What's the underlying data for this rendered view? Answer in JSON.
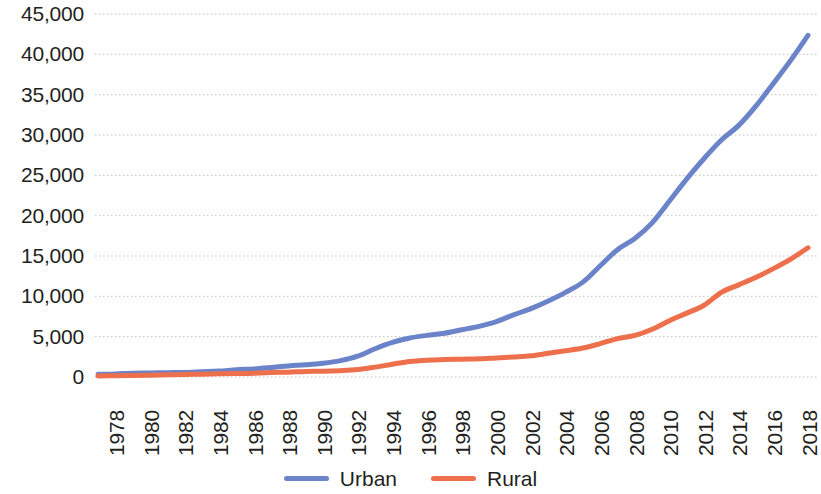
{
  "chart_data": {
    "type": "line",
    "title": "",
    "subtitle": "",
    "xlabel": "",
    "ylabel": "",
    "grid": true,
    "grid_axis": "y",
    "legend_position": "bottom-center",
    "xlim": [
      1978,
      2019
    ],
    "ylim": [
      0,
      45000
    ],
    "y_ticks": [
      0,
      5000,
      10000,
      15000,
      20000,
      25000,
      30000,
      35000,
      40000,
      45000
    ],
    "y_tick_labels": [
      "0",
      "5,000",
      "10,000",
      "15,000",
      "20,000",
      "25,000",
      "30,000",
      "35,000",
      "40,000",
      "45,000"
    ],
    "x_ticks": [
      1978,
      1980,
      1982,
      1984,
      1986,
      1988,
      1990,
      1992,
      1994,
      1996,
      1998,
      2000,
      2002,
      2004,
      2006,
      2008,
      2010,
      2012,
      2014,
      2016,
      2018
    ],
    "x_tick_labels": [
      "1978",
      "1980",
      "1982",
      "1984",
      "1986",
      "1988",
      "1990",
      "1992",
      "1994",
      "1996",
      "1998",
      "2000",
      "2002",
      "2004",
      "2006",
      "2008",
      "2010",
      "2012",
      "2014",
      "2016",
      "2018"
    ],
    "x_tick_rotation": -90,
    "x": [
      1978,
      1979,
      1980,
      1981,
      1982,
      1983,
      1984,
      1985,
      1986,
      1987,
      1988,
      1989,
      1990,
      1991,
      1992,
      1993,
      1994,
      1995,
      1996,
      1997,
      1998,
      1999,
      2000,
      2001,
      2002,
      2003,
      2004,
      2005,
      2006,
      2007,
      2008,
      2009,
      2010,
      2011,
      2012,
      2013,
      2014,
      2015,
      2016,
      2017,
      2018,
      2019
    ],
    "series": [
      {
        "name": "Urban",
        "color": "#6b83c8",
        "values": [
          343,
          387,
          478,
          500,
          535,
          564,
          652,
          739,
          900,
          1002,
          1181,
          1376,
          1510,
          1701,
          2027,
          2577,
          3496,
          4283,
          4839,
          5160,
          5425,
          5854,
          6280,
          6867,
          7703,
          8472,
          9422,
          10493,
          11759,
          13786,
          15781,
          17175,
          19109,
          21810,
          24565,
          27091,
          29381,
          31195,
          33616,
          36396,
          39251,
          42359
        ]
      },
      {
        "name": "Rural",
        "color": "#ed6f4c",
        "values": [
          134,
          160,
          191,
          223,
          270,
          310,
          355,
          398,
          424,
          463,
          545,
          602,
          686,
          709,
          784,
          922,
          1221,
          1578,
          1926,
          2090,
          2162,
          2210,
          2253,
          2366,
          2476,
          2622,
          2936,
          3255,
          3587,
          4140,
          4761,
          5153,
          5919,
          6977,
          7917,
          8896,
          10489,
          11422,
          12363,
          13432,
          14617,
          16021
        ]
      }
    ],
    "legend": [
      {
        "label": "Urban",
        "color": "#6b83c8"
      },
      {
        "label": "Rural",
        "color": "#ed6f4c"
      }
    ],
    "colors": {
      "urban": "#6b83c8",
      "rural": "#ed6f4c",
      "grid": "#bfbfbf",
      "text": "#231f20",
      "background": "#ffffff"
    }
  }
}
